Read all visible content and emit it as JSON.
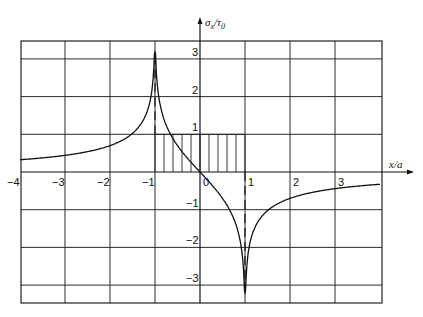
{
  "chart_data": {
    "type": "line",
    "title": "",
    "xlabel": "x/a",
    "ylabel": "σx/τ0",
    "xlim": [
      -4,
      4
    ],
    "ylim": [
      -3.5,
      3.5
    ],
    "grid": true,
    "x_ticks": [
      "-4",
      "-3",
      "-2",
      "-1",
      "0",
      "1",
      "2",
      "3"
    ],
    "y_ticks": [
      "3",
      "2",
      "1",
      "-1",
      "-2",
      "-3"
    ],
    "series": [
      {
        "name": "σx/τ0 = -(2/π)·ln|(x+1)/(x-1)|",
        "x": [
          -4,
          -3.5,
          -3,
          -2.5,
          -2,
          -1.6,
          -1.3,
          -1.1,
          -1.02,
          -1.0,
          -0.98,
          -0.9,
          -0.7,
          -0.5,
          -0.3,
          0,
          0.3,
          0.5,
          0.7,
          0.9,
          0.98,
          1.0,
          1.02,
          1.1,
          1.3,
          1.6,
          2,
          2.5,
          3,
          3.5,
          4
        ],
        "values": [
          0.33,
          0.38,
          0.44,
          0.54,
          0.7,
          0.93,
          1.3,
          1.94,
          3.1,
          3.15,
          3.1,
          1.88,
          1.11,
          0.7,
          0.39,
          0.0,
          -0.39,
          -0.7,
          -1.11,
          -1.88,
          -3.1,
          -3.15,
          -3.1,
          -1.94,
          -1.3,
          -0.93,
          -0.7,
          -0.54,
          -0.44,
          -0.38,
          -0.33
        ]
      }
    ],
    "annotations": [
      {
        "type": "hatched-rectangle",
        "x": [
          -1,
          1
        ],
        "y": [
          0,
          1
        ],
        "meaning": "uniform shear load τ0"
      },
      {
        "type": "dashed-line",
        "x": -1,
        "y": [
          1,
          3.15
        ]
      },
      {
        "type": "dashed-line",
        "x": 1,
        "y": [
          0,
          -3.15
        ]
      }
    ],
    "legend": null
  },
  "labels": {
    "y_axis_main": "σ",
    "y_axis_sub": "x",
    "y_axis_den": "/τ",
    "y_axis_den_sub": "0",
    "x_axis": "x/a"
  },
  "ticks": {
    "x": [
      {
        "v": -4,
        "t": "−4"
      },
      {
        "v": -3,
        "t": "−3"
      },
      {
        "v": -2,
        "t": "−2"
      },
      {
        "v": -1,
        "t": "−1"
      },
      {
        "v": 0,
        "t": "0"
      },
      {
        "v": 1,
        "t": "1"
      },
      {
        "v": 2,
        "t": "2"
      },
      {
        "v": 3,
        "t": "3"
      }
    ],
    "y": [
      {
        "v": 3,
        "t": "3"
      },
      {
        "v": 2,
        "t": "2"
      },
      {
        "v": 1,
        "t": "1"
      },
      {
        "v": -1,
        "t": "−1"
      },
      {
        "v": -2,
        "t": "−2"
      },
      {
        "v": -3,
        "t": "−3"
      }
    ]
  }
}
